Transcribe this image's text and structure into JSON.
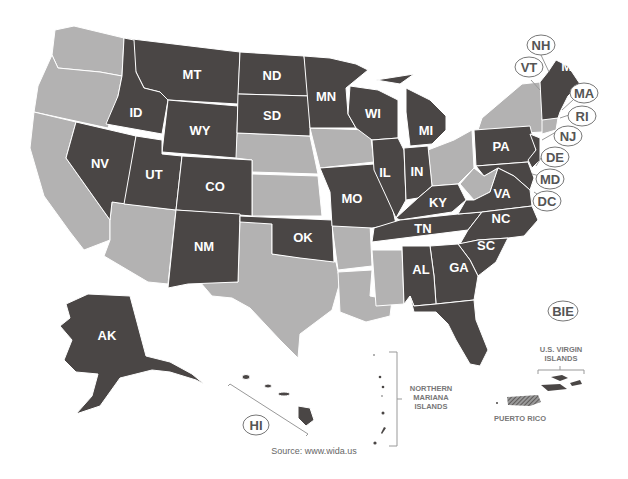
{
  "map": {
    "title": "WIDA Consortium member states",
    "colors": {
      "member": "#4a4645",
      "non_member": "#b3b2b2",
      "border": "#ffffff",
      "callout": "#555555"
    },
    "legend_implicit": {
      "member": "dark gray",
      "non_member": "light gray"
    },
    "member_labels": {
      "MT": "MT",
      "ND": "ND",
      "MN": "MN",
      "ID": "ID",
      "WY": "WY",
      "SD": "SD",
      "WI": "WI",
      "MI": "MI",
      "NV": "NV",
      "UT": "UT",
      "CO": "CO",
      "IL": "IL",
      "IN": "IN",
      "PA": "PA",
      "MO": "MO",
      "KY": "KY",
      "VA": "VA",
      "NM": "NM",
      "OK": "OK",
      "TN": "TN",
      "NC": "NC",
      "SC": "SC",
      "AL": "AL",
      "GA": "GA",
      "FL": "FL",
      "AK": "AK"
    },
    "callouts": {
      "NH": "NH",
      "VT": "VT",
      "ME": "ME",
      "MA": "MA",
      "RI": "RI",
      "NJ": "NJ",
      "DE": "DE",
      "MD": "MD",
      "DC": "DC",
      "HI": "HI",
      "BIE": "BIE"
    },
    "territories": {
      "nmi_line1": "NORTHERN",
      "nmi_line2": "MARIANA",
      "nmi_line3": "ISLANDS",
      "usvi_line1": "U.S. VIRGIN",
      "usvi_line2": "ISLANDS",
      "pr": "PUERTO RICO"
    },
    "source": "Source: www.wida.us"
  }
}
